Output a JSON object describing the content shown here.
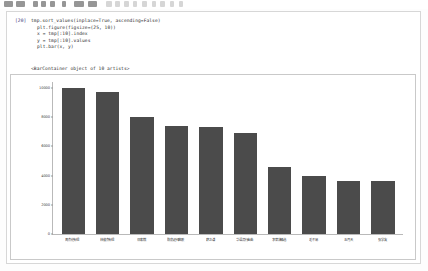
{
  "window": {
    "top_chrome_blobs": [
      {
        "x": 4,
        "w": 9
      },
      {
        "x": 16,
        "w": 9
      },
      {
        "x": 33,
        "w": 5
      },
      {
        "x": 41,
        "w": 5
      },
      {
        "x": 50,
        "w": 5
      },
      {
        "x": 62,
        "w": 4
      },
      {
        "x": 74,
        "w": 10
      },
      {
        "x": 88,
        "w": 9
      },
      {
        "x": 106,
        "w": 6
      },
      {
        "x": 115,
        "w": 5
      },
      {
        "x": 124,
        "w": 5
      },
      {
        "x": 133,
        "w": 4
      },
      {
        "x": 142,
        "w": 5
      },
      {
        "x": 152,
        "w": 4
      },
      {
        "x": 160,
        "w": 5
      },
      {
        "x": 170,
        "w": 4
      },
      {
        "x": 179,
        "w": 4
      }
    ]
  },
  "cell": {
    "prompt": "[20]",
    "code_lines": [
      "tmp.sort_values(inplace=True, ascending=False)",
      "plt.figure(figsize=(25, 10))",
      "x = tmp[:10].index",
      "y = tmp[:10].values",
      "plt.bar(x, y)"
    ],
    "output_text": "<BarContainer object of 10 artists>"
  },
  "chart_data": {
    "type": "bar",
    "title": "",
    "xlabel": "",
    "ylabel": "",
    "ylim": [
      0,
      10400
    ],
    "grid": false,
    "legend": null,
    "bar_color": "#4b4b4b",
    "yticks": [
      0,
      2000,
      4000,
      6000,
      8000,
      10000
    ],
    "ytick_labels": [
      "0",
      "2000",
      "4000",
      "6000",
      "8000",
      "10000"
    ],
    "categories": [
      "周杰伦专辑",
      "林俊杰专辑",
      "邓紫棋",
      "陈奕迅经典歌",
      "薛之谦",
      "华语流行金曲",
      "李荣浩精选",
      "毛不易",
      "五月天",
      "张学友"
    ],
    "values": [
      10000,
      9700,
      8000,
      7400,
      7300,
      6900,
      4600,
      4000,
      3600,
      3600
    ]
  }
}
